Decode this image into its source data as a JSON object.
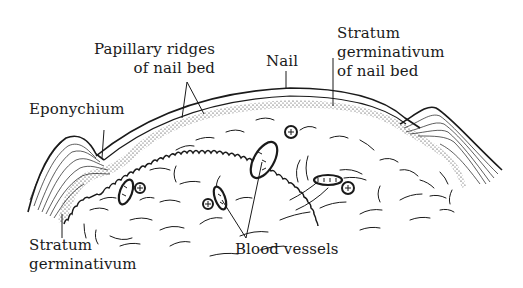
{
  "diagram": {
    "labels": {
      "papillary_ridges": {
        "line1": "Papillary ridges",
        "line2": "of nail bed"
      },
      "nail": "Nail",
      "stratum_germinativum_nail_bed": {
        "line1": "Stratum",
        "line2": "germinativum",
        "line3": "of nail bed"
      },
      "eponychium": "Eponychium",
      "stratum_germinativum": {
        "line1": "Stratum",
        "line2": "germinativum"
      },
      "blood_vessels": "Blood vessels"
    },
    "colors": {
      "ink": "#1a1a1a",
      "background": "#ffffff"
    }
  }
}
